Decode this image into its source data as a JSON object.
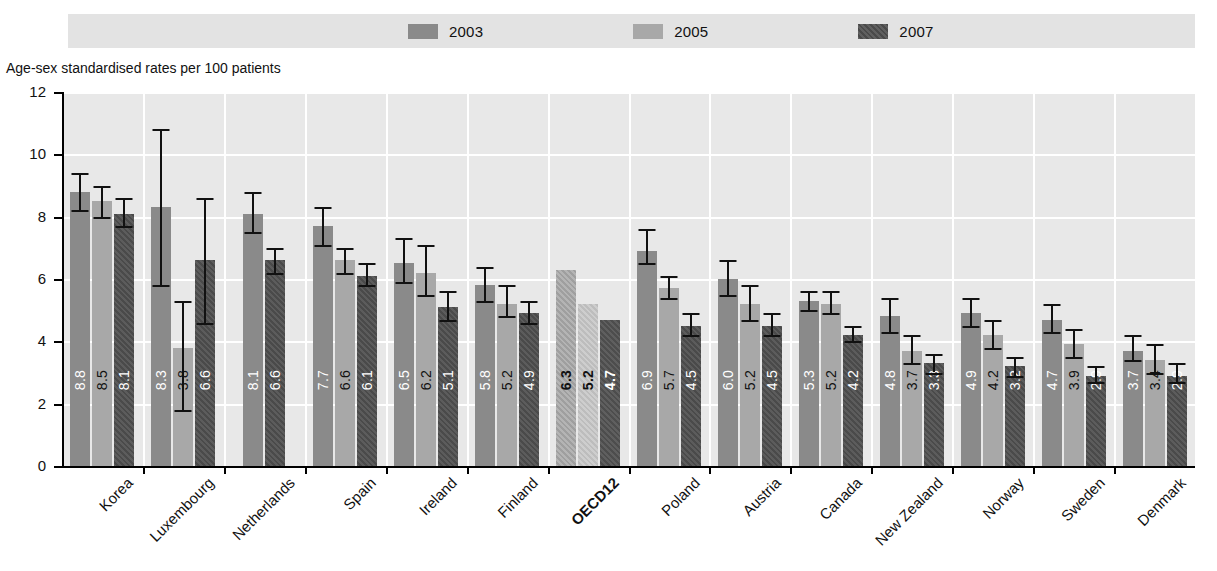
{
  "legend": {
    "entries": [
      {
        "label": "2003",
        "swatch": "#8a8a8a"
      },
      {
        "label": "2005",
        "swatch": "#a8a8a8"
      },
      {
        "label": "2007",
        "swatch": "#4a4a4a"
      }
    ]
  },
  "axis": {
    "y_title": "Age-sex standardised rates per 100 patients",
    "y_ticks": [
      "0",
      "2",
      "4",
      "6",
      "8",
      "10",
      "12"
    ]
  },
  "chart_data": {
    "type": "bar",
    "title": "",
    "subtitle": "",
    "xlabel": "",
    "ylabel": "Age-sex standardised rates per 100 patients",
    "ylim": [
      0,
      12
    ],
    "yticks": [
      0,
      2,
      4,
      6,
      8,
      10,
      12
    ],
    "grid": true,
    "legend_position": "top",
    "categories": [
      "Korea",
      "Luxembourg",
      "Netherlands",
      "Spain",
      "Ireland",
      "Finland",
      "OECD12",
      "Poland",
      "Austria",
      "Canada",
      "New Zealand",
      "Norway",
      "Sweden",
      "Denmark"
    ],
    "highlight_category": "OECD12",
    "series": [
      {
        "name": "2003",
        "values": [
          8.8,
          8.3,
          8.1,
          7.7,
          6.5,
          5.8,
          6.3,
          6.9,
          6.0,
          5.3,
          4.8,
          4.9,
          4.7,
          3.7
        ]
      },
      {
        "name": "2005",
        "values": [
          8.5,
          3.8,
          null,
          6.6,
          6.2,
          5.2,
          5.2,
          5.7,
          5.2,
          5.2,
          3.7,
          4.2,
          3.9,
          3.4
        ]
      },
      {
        "name": "2007",
        "values": [
          8.1,
          6.6,
          6.6,
          6.1,
          5.1,
          4.9,
          4.7,
          4.5,
          4.5,
          4.2,
          3.3,
          3.2,
          2.9,
          2.9
        ]
      }
    ],
    "error_bars": {
      "2003": [
        [
          8.2,
          9.4
        ],
        [
          5.8,
          10.8
        ],
        [
          7.5,
          8.8
        ],
        [
          7.1,
          8.3
        ],
        [
          5.9,
          7.3
        ],
        [
          5.3,
          6.4
        ],
        null,
        [
          6.5,
          7.6
        ],
        [
          5.5,
          6.6
        ],
        [
          5.0,
          5.6
        ],
        [
          4.3,
          5.4
        ],
        [
          4.5,
          5.4
        ],
        [
          4.3,
          5.2
        ],
        [
          3.4,
          4.2
        ]
      ],
      "2005": [
        [
          8.0,
          9.0
        ],
        [
          1.8,
          5.3
        ],
        null,
        [
          6.2,
          7.0
        ],
        [
          5.5,
          7.1
        ],
        [
          4.8,
          5.8
        ],
        null,
        [
          5.4,
          6.1
        ],
        [
          4.7,
          5.8
        ],
        [
          4.9,
          5.6
        ],
        [
          3.3,
          4.2
        ],
        [
          3.8,
          4.7
        ],
        [
          3.5,
          4.4
        ],
        [
          3.0,
          3.9
        ]
      ],
      "2007": [
        [
          7.7,
          8.6
        ],
        [
          4.6,
          8.6
        ],
        [
          6.2,
          7.0
        ],
        [
          5.8,
          6.5
        ],
        [
          4.7,
          5.6
        ],
        [
          4.6,
          5.3
        ],
        null,
        [
          4.2,
          4.9
        ],
        [
          4.2,
          4.9
        ],
        [
          4.0,
          4.5
        ],
        [
          3.0,
          3.6
        ],
        [
          2.9,
          3.5
        ],
        [
          2.7,
          3.2
        ],
        [
          2.7,
          3.3
        ]
      ]
    }
  }
}
